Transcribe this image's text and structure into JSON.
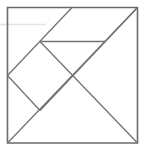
{
  "figure": {
    "name": "tangram-square-dissection",
    "title": "Tangram square dissection diagram",
    "background_color": "#ffffff",
    "canvas": {
      "width": 145,
      "height": 153
    }
  },
  "style": {
    "outline_color": "#6b6b6b",
    "outline_width": 1.6,
    "inner_color": "#737373",
    "inner_width": 1.3,
    "artifact_color": "#e2e2e2",
    "artifact_width": 1.6
  },
  "geometry": {
    "square": {
      "left": 7.5,
      "top": 7.5,
      "right": 137.5,
      "bottom": 143.0
    },
    "points": {
      "top_left": [
        7.5,
        7.5
      ],
      "top_mid": [
        72.0,
        7.5
      ],
      "top_right": [
        137.5,
        7.5
      ],
      "left_mid": [
        7.5,
        75.5
      ],
      "center": [
        75.0,
        75.0
      ],
      "bottom_left": [
        7.5,
        143.0
      ],
      "bottom_right": [
        137.5,
        143.0
      ],
      "notch": [
        40.0,
        110.5
      ],
      "bar_left": [
        40.0,
        41.5
      ],
      "bar_right": [
        106.0,
        41.5
      ]
    },
    "segments": [
      {
        "name": "outer-square",
        "kind": "rect",
        "points": "7.5,7.5 137.5,7.5 137.5,143 7.5,143"
      },
      {
        "name": "main-diagonal-bl-tr",
        "kind": "line",
        "points": "7.5,143 137.5,7.5"
      },
      {
        "name": "diagonal-topmid-to-leftmid",
        "kind": "line",
        "points": "72,7.5 7.5,75.5"
      },
      {
        "name": "diagonal-leftmid-to-notch",
        "kind": "line",
        "points": "7.5,75.5 40,110.5"
      },
      {
        "name": "diagonal-notch-to-topright",
        "kind": "line",
        "points": "40,110.5 137.5,7.5"
      },
      {
        "name": "diagonal-barleft-to-bottomright",
        "kind": "line",
        "points": "40,41.5 137.5,143"
      },
      {
        "name": "horizontal-bar",
        "kind": "line",
        "points": "40,41.5 106,41.5"
      }
    ],
    "artifact": {
      "name": "scan-artifact-line",
      "points": "0,24.5 46,24.5"
    }
  },
  "pieces": [
    {
      "label": "large-triangle-upper-right"
    },
    {
      "label": "large-triangle-lower-right"
    },
    {
      "label": "medium-triangle-left"
    },
    {
      "label": "small-triangle-upper"
    },
    {
      "label": "small-triangle-lower"
    },
    {
      "label": "square-piece"
    },
    {
      "label": "parallelogram-piece"
    }
  ]
}
